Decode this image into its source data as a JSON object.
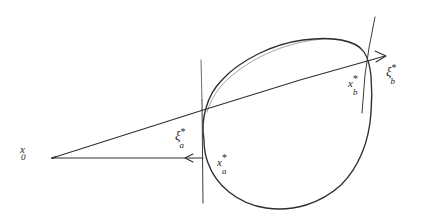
{
  "figure": {
    "kind": "hand-drawn-diagram",
    "background_color": "#ffffff",
    "ink_color": "#2b2b2b",
    "width": 427,
    "height": 223
  },
  "labels": {
    "x0": {
      "base": "x",
      "sup": "",
      "sub": "0"
    },
    "xi_a": {
      "base": "ξ",
      "sup": "*",
      "sub": "a"
    },
    "xi_b": {
      "base": "ξ",
      "sup": "*",
      "sub": "b"
    },
    "xstar_a": {
      "base": "x",
      "sup": "*",
      "sub": "a"
    },
    "xstar_b": {
      "base": "x",
      "sup": "*",
      "sub": "b"
    }
  },
  "geometry": {
    "origin_point": {
      "x": 52,
      "y": 158
    },
    "blob_label": "convex-set-outline",
    "supporting_line_left": "vertical-tangent-line",
    "supporting_line_right": "slanted-tangent-line",
    "ray_lower": "horizontal-ray-with-left-arrowhead",
    "ray_upper": "slanted-ray-with-right-arrowhead"
  }
}
